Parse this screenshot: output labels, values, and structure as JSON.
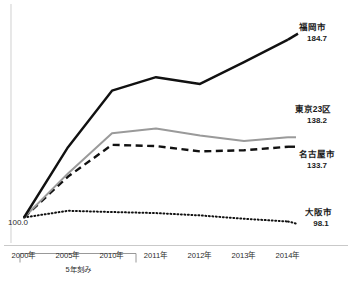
{
  "chart_data": {
    "type": "line",
    "title": "",
    "subtitle": "",
    "xlabel": "",
    "ylabel": "",
    "grid": false,
    "legend_position": "right-end-labels",
    "x": [
      "2000年",
      "2005年",
      "2010年",
      "2011年",
      "2012年",
      "2013年",
      "2014年"
    ],
    "x_numeric": [
      2000,
      2005,
      2010,
      2011,
      2012,
      2013,
      2014
    ],
    "baseline_label": "100.0",
    "baseline_value": 100.0,
    "ylim": [
      95,
      195
    ],
    "axis_note": "5年刻み",
    "series": [
      {
        "name": "福岡市",
        "end_value": 184.7,
        "style": "solid",
        "color": "#111111",
        "values": [
          100.0,
          133.5,
          160.4,
          166.8,
          163.6,
          174.0,
          184.7
        ]
      },
      {
        "name": "東京23区",
        "end_value": 138.2,
        "style": "solid",
        "color": "#9a9a9a",
        "values": [
          100.0,
          121.0,
          140.1,
          142.4,
          139.0,
          136.4,
          138.2
        ]
      },
      {
        "name": "名古屋市",
        "end_value": 133.7,
        "style": "dashed",
        "color": "#111111",
        "values": [
          100.0,
          119.5,
          134.6,
          134.0,
          131.5,
          132.0,
          133.7
        ]
      },
      {
        "name": "大阪市",
        "end_value": 98.1,
        "style": "dotted",
        "color": "#111111",
        "values": [
          100.0,
          103.2,
          102.6,
          102.1,
          101.0,
          99.4,
          98.1
        ]
      }
    ]
  },
  "labels": {
    "fukuoka_name": "福岡市",
    "fukuoka_value": "184.7",
    "tokyo_name": "東京23区",
    "tokyo_value": "138.2",
    "nagoya_name": "名古屋市",
    "nagoya_value": "133.7",
    "osaka_name": "大阪市",
    "osaka_value": "98.1",
    "baseline": "100.0"
  },
  "axis": {
    "ticks": [
      "2000年",
      "2005年",
      "2010年",
      "2011年",
      "2012年",
      "2013年",
      "2014年"
    ],
    "bracket_caption": "5年刻み"
  },
  "colors": {
    "series_fukuoka": "#111111",
    "series_tokyo": "#9a9a9a",
    "series_nagoya": "#111111",
    "series_osaka": "#111111",
    "axis_line": "#bdbdbd",
    "text": "#1a1a1a"
  }
}
